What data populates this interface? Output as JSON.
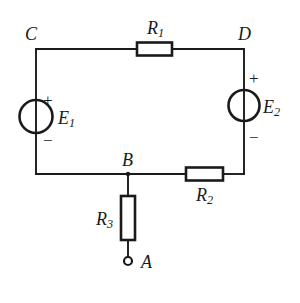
{
  "diagram": {
    "background_color": "#ffffff",
    "line_color": "#1a1a1a",
    "nodes": [
      {
        "id": "node-c",
        "label": "C",
        "x": 36,
        "y": 49
      },
      {
        "id": "node-d",
        "label": "D",
        "x": 244,
        "y": 49
      },
      {
        "id": "node-b",
        "label": "B",
        "x": 128,
        "y": 174
      },
      {
        "id": "node-a",
        "label": "A",
        "x": 128,
        "y": 261
      }
    ],
    "components": [
      {
        "id": "resistor-r1",
        "type": "resistor",
        "label": "R",
        "subscript": "1",
        "orientation": "horizontal",
        "between": "C-D"
      },
      {
        "id": "resistor-r2",
        "type": "resistor",
        "label": "R",
        "subscript": "2",
        "orientation": "horizontal",
        "between": "B-bottom-right"
      },
      {
        "id": "resistor-r3",
        "type": "resistor",
        "label": "R",
        "subscript": "3",
        "orientation": "vertical",
        "between": "B-A"
      },
      {
        "id": "source-e1",
        "type": "voltage-source",
        "label": "E",
        "subscript": "1",
        "orientation": "vertical",
        "plus_terminal": "top",
        "minus_terminal": "bottom",
        "plus_sign": "+",
        "minus_sign": "−",
        "between": "C-bottom-left"
      },
      {
        "id": "source-e2",
        "type": "voltage-source",
        "label": "E",
        "subscript": "2",
        "orientation": "vertical",
        "plus_terminal": "top",
        "minus_terminal": "bottom",
        "plus_sign": "+",
        "minus_sign": "−",
        "between": "D-bottom-right"
      }
    ],
    "terminals": [
      {
        "id": "terminal-a",
        "label": "A",
        "style": "open-circle"
      }
    ],
    "labels": {
      "node_c": "C",
      "node_d": "D",
      "node_b": "B",
      "node_a": "A",
      "r1_base": "R",
      "r1_sub": "1",
      "r2_base": "R",
      "r2_sub": "2",
      "r3_base": "R",
      "r3_sub": "3",
      "e1_base": "E",
      "e1_sub": "1",
      "e2_base": "E",
      "e2_sub": "2",
      "e1_plus": "+",
      "e1_minus": "−",
      "e2_plus": "+",
      "e2_minus": "−"
    }
  }
}
